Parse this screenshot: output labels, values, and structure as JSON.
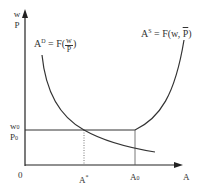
{
  "diagram": {
    "type": "economics-labor-market",
    "y_axis": {
      "label_top": "w",
      "label_bottom": "P"
    },
    "x_axis": {
      "label": "A"
    },
    "origin": "0",
    "demand_curve": {
      "lhs": "A",
      "superscript": "D",
      "eq": " = F(",
      "frac_num": "w",
      "frac_den": "P",
      "close": ")"
    },
    "supply_curve": {
      "lhs": "A",
      "superscript": "S",
      "eq": " = F(w, ",
      "p_bar": "P",
      "close": ")"
    },
    "wage_level": {
      "top": "w",
      "top_sub": "0",
      "bottom": "P",
      "bottom_sub": "0"
    },
    "x_markers": [
      {
        "label": "A",
        "superscript": "*",
        "style": "dotted"
      },
      {
        "label": "A",
        "subscript": "0",
        "style": "solid"
      }
    ],
    "colors": {
      "axis": "#222222",
      "curve": "#333333",
      "guide": "#555555"
    }
  }
}
